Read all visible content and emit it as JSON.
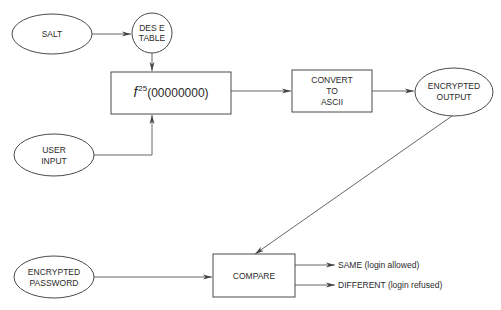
{
  "diagram": {
    "type": "flowchart",
    "title": "",
    "nodes": {
      "salt": {
        "shape": "ellipse",
        "lines": [
          "SALT"
        ]
      },
      "des_table": {
        "shape": "circle",
        "lines": [
          "DES E",
          "TABLE"
        ]
      },
      "function": {
        "shape": "box",
        "func": "f",
        "exponent": "25",
        "argument": "(00000000)"
      },
      "user_input": {
        "shape": "ellipse",
        "lines": [
          "USER",
          "INPUT"
        ]
      },
      "convert": {
        "shape": "box",
        "lines": [
          "CONVERT",
          "TO",
          "ASCII"
        ]
      },
      "encrypted_output": {
        "shape": "ellipse",
        "lines": [
          "ENCRYPTED",
          "OUTPUT"
        ]
      },
      "encrypted_password": {
        "shape": "ellipse",
        "lines": [
          "ENCRYPTED",
          "PASSWORD"
        ]
      },
      "compare": {
        "shape": "box",
        "lines": [
          "COMPARE"
        ]
      }
    },
    "outcomes": {
      "same": "SAME (login allowed)",
      "different": "DIFFERENT (login refused)"
    },
    "edges": [
      {
        "from": "salt",
        "to": "des_table"
      },
      {
        "from": "des_table",
        "to": "function"
      },
      {
        "from": "user_input",
        "to": "function"
      },
      {
        "from": "function",
        "to": "convert"
      },
      {
        "from": "convert",
        "to": "encrypted_output"
      },
      {
        "from": "encrypted_output",
        "to": "compare"
      },
      {
        "from": "encrypted_password",
        "to": "compare"
      },
      {
        "from": "compare",
        "to": "same"
      },
      {
        "from": "compare",
        "to": "different"
      }
    ]
  }
}
